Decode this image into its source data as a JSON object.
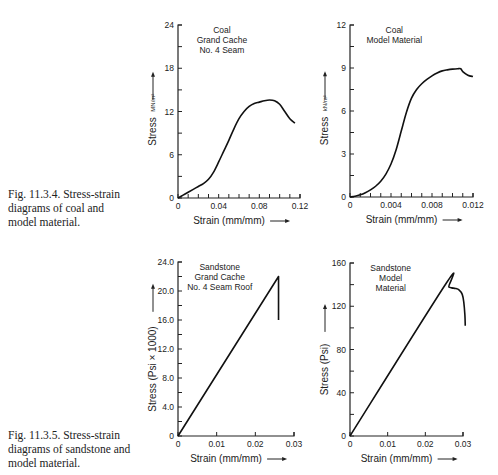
{
  "captions": [
    {
      "lines": [
        "Fig. 11.3.4.  Stress-strain",
        "diagrams of coal and",
        "model material."
      ]
    },
    {
      "lines": [
        "Fig. 11.3.5.  Stress-strain",
        "diagrams of sandstone and",
        "model material."
      ]
    }
  ],
  "chart_data": [
    {
      "type": "line",
      "title": "Coal Grand Cache No. 4 Seam",
      "title_lines": [
        "Coal",
        "Grand Cache",
        "No. 4 Seam"
      ],
      "xlabel": "Strain (mm/mm)",
      "ylabel": "Stress",
      "yunit": "MN/m²",
      "xlim": [
        0,
        0.12
      ],
      "ylim": [
        0,
        24
      ],
      "xticks": [
        0,
        0.04,
        0.08,
        0.12
      ],
      "xtick_labels": [
        "0",
        "0.04",
        "0.08",
        "0.12"
      ],
      "x_minor_step": 0.01,
      "yticks": [
        0,
        6,
        12,
        18,
        24
      ],
      "ytick_labels": [
        "0",
        "6",
        "12",
        "18",
        "24"
      ],
      "y_minor_step": 3,
      "grid": false,
      "frame": {
        "x0": 178,
        "y0": 198,
        "x1": 300,
        "y1": 25
      },
      "series": [
        {
          "name": "Coal",
          "x": [
            0,
            0.005,
            0.01,
            0.015,
            0.02,
            0.025,
            0.03,
            0.035,
            0.04,
            0.045,
            0.05,
            0.055,
            0.06,
            0.065,
            0.07,
            0.075,
            0.08,
            0.085,
            0.09,
            0.095,
            0.1,
            0.105,
            0.11,
            0.115
          ],
          "y": [
            0,
            0.4,
            0.8,
            1.2,
            1.6,
            2.0,
            2.6,
            3.6,
            5.0,
            6.5,
            8.0,
            9.6,
            11.0,
            12.0,
            12.7,
            13.1,
            13.3,
            13.5,
            13.6,
            13.5,
            13.0,
            12.0,
            11.0,
            10.4
          ]
        }
      ]
    },
    {
      "type": "line",
      "title": "Coal Model Material",
      "title_lines": [
        "Coal",
        "Model Material"
      ],
      "xlabel": "Strain (mm/mm)",
      "ylabel": "Stress",
      "yunit": "kN/m²",
      "xlim": [
        0,
        0.012
      ],
      "ylim": [
        0,
        12
      ],
      "xticks": [
        0,
        0.004,
        0.008,
        0.012
      ],
      "xtick_labels": [
        "0",
        "0.004",
        "0.008",
        "0.012"
      ],
      "x_minor_step": 0.001,
      "yticks": [
        0,
        3,
        6,
        9,
        12
      ],
      "ytick_labels": [
        "0",
        "3",
        "6",
        "9",
        "12"
      ],
      "y_minor_step": 1.5,
      "grid": false,
      "frame": {
        "x0": 350,
        "y0": 197,
        "x1": 473,
        "y1": 25
      },
      "series": [
        {
          "name": "Coal model",
          "x": [
            0,
            0.0005,
            0.001,
            0.0015,
            0.002,
            0.0025,
            0.003,
            0.0035,
            0.004,
            0.0045,
            0.005,
            0.0055,
            0.006,
            0.0065,
            0.007,
            0.0075,
            0.008,
            0.0085,
            0.009,
            0.0095,
            0.01,
            0.0105,
            0.0108,
            0.011,
            0.0115,
            0.012
          ],
          "y": [
            0,
            0.05,
            0.15,
            0.3,
            0.5,
            0.75,
            1.1,
            1.6,
            2.3,
            3.3,
            4.6,
            5.9,
            6.9,
            7.5,
            7.9,
            8.2,
            8.45,
            8.65,
            8.8,
            8.87,
            8.92,
            8.95,
            8.95,
            8.75,
            8.5,
            8.4
          ]
        }
      ]
    },
    {
      "type": "line",
      "title": "Sandstone Grand Cache No. 4 Seam Roof",
      "title_lines": [
        "Sandstone",
        "Grand Cache",
        "No. 4 Seam Roof"
      ],
      "xlabel": "Strain (mm/mm)",
      "ylabel": "Stress (Psi × 1000)",
      "xlim": [
        0,
        0.03
      ],
      "ylim": [
        0,
        24
      ],
      "xticks": [
        0,
        0.01,
        0.02,
        0.03
      ],
      "xtick_labels": [
        "0",
        "0.01",
        "0.02",
        "0.03"
      ],
      "x_minor_step": 0.01,
      "yticks": [
        0,
        4,
        8,
        12,
        16,
        20,
        24
      ],
      "ytick_labels": [
        "0",
        "4.0",
        "8.0",
        "12.0",
        "16.0",
        "20.0",
        "24.0"
      ],
      "y_minor_step": 2,
      "grid": false,
      "frame": {
        "x0": 178,
        "y0": 436,
        "x1": 294,
        "y1": 262
      },
      "series": [
        {
          "name": "Sandstone",
          "x": [
            0,
            0.026,
            0.026
          ],
          "y": [
            0,
            22.0,
            16.0
          ]
        }
      ]
    },
    {
      "type": "line",
      "title": "Sandstone Model Material",
      "title_lines": [
        "Sandstone",
        "Model",
        "Material"
      ],
      "xlabel": "Strain (mm/mm)",
      "ylabel": "Stress (Psi)",
      "xlim": [
        0,
        0.03
      ],
      "ylim": [
        0,
        160
      ],
      "xticks": [
        0,
        0.01,
        0.02,
        0.03
      ],
      "xtick_labels": [
        "0",
        "0.01",
        "0.02",
        "0.03"
      ],
      "x_minor_step": 0.01,
      "yticks": [
        0,
        40,
        80,
        120,
        160
      ],
      "ytick_labels": [
        "0",
        "40",
        "80",
        "120",
        "160"
      ],
      "y_minor_step": 20,
      "grid": false,
      "frame": {
        "x0": 350,
        "y0": 436,
        "x1": 463,
        "y1": 263
      },
      "series": [
        {
          "name": "Sandstone model",
          "x": [
            0,
            0.0255,
            0.0262,
            0.027,
            0.028,
            0.029,
            0.0298,
            0.0302,
            0.0305,
            0.0306
          ],
          "y": [
            0,
            141,
            138,
            137,
            136.5,
            135,
            131,
            124,
            112,
            102
          ]
        }
      ]
    }
  ]
}
